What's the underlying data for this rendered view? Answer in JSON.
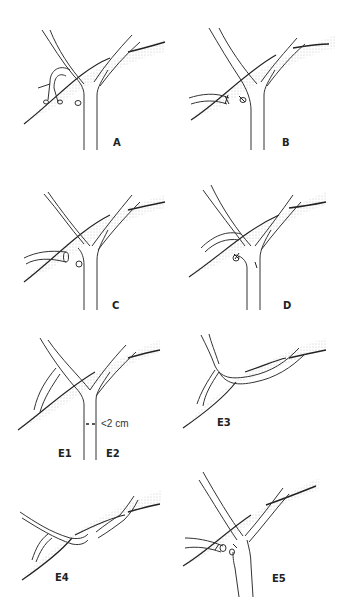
{
  "figure": {
    "colors": {
      "stroke": "#2a2a2a",
      "stipple": "#9a9a9a",
      "background": "#ffffff"
    },
    "panels": [
      {
        "id": "A",
        "label": "A"
      },
      {
        "id": "B",
        "label": "B"
      },
      {
        "id": "C",
        "label": "C"
      },
      {
        "id": "D",
        "label": "D"
      },
      {
        "id": "E1E2",
        "label_left": "E1",
        "label_right": "E2",
        "measure_left": ">2 cm",
        "measure_right": "<2 cm"
      },
      {
        "id": "E3",
        "label": "E3"
      },
      {
        "id": "E4",
        "label": "E4"
      },
      {
        "id": "E5",
        "label": "E5"
      }
    ]
  }
}
